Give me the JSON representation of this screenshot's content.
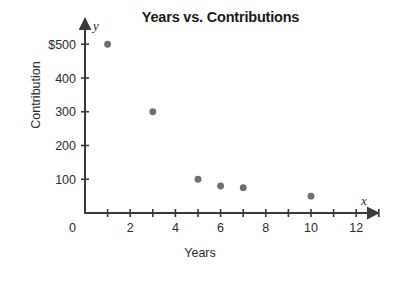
{
  "chart_data": {
    "type": "scatter",
    "title": "Years vs. Contributions",
    "xlabel": "Years",
    "ylabel": "Contribution",
    "x_axis_var": "x",
    "y_axis_var": "y",
    "xlim": [
      0,
      13
    ],
    "ylim": [
      0,
      530
    ],
    "grid": false,
    "legend": null,
    "x_ticks": [
      1,
      2,
      3,
      4,
      5,
      6,
      7,
      8,
      9,
      10,
      11,
      12,
      13
    ],
    "x_tick_labels": [
      {
        "value": 2,
        "label": "2"
      },
      {
        "value": 4,
        "label": "4"
      },
      {
        "value": 6,
        "label": "6"
      },
      {
        "value": 8,
        "label": "8"
      },
      {
        "value": 10,
        "label": "10"
      },
      {
        "value": 12,
        "label": "12"
      }
    ],
    "origin_label": "0",
    "y_ticks": [
      100,
      200,
      300,
      400,
      500
    ],
    "y_tick_labels": [
      {
        "value": 500,
        "label": "$500"
      },
      {
        "value": 400,
        "label": "400"
      },
      {
        "value": 300,
        "label": "300"
      },
      {
        "value": 200,
        "label": "200"
      },
      {
        "value": 100,
        "label": "100"
      }
    ],
    "point_color": "#6e6e6e",
    "axis_color": "#3a3a3a",
    "points": [
      {
        "x": 1,
        "y": 500
      },
      {
        "x": 3,
        "y": 300
      },
      {
        "x": 5,
        "y": 100
      },
      {
        "x": 6,
        "y": 80
      },
      {
        "x": 7,
        "y": 75
      },
      {
        "x": 10,
        "y": 50
      }
    ]
  }
}
